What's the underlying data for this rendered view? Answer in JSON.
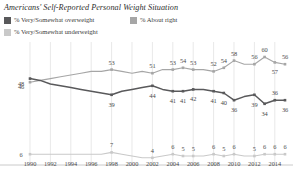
{
  "chart_data": {
    "type": "line",
    "title": "Americans' Self-Reported Personal Weight Situation",
    "xlabel": "",
    "ylabel": "",
    "ylim": [
      0,
      65
    ],
    "xlim": [
      1990,
      2015
    ],
    "grid": "vertical",
    "legend_position": "top-left",
    "x": [
      1990,
      1991,
      1992,
      1993,
      1994,
      1995,
      1996,
      1997,
      1998,
      1999,
      2000,
      2001,
      2002,
      2003,
      2004,
      2005,
      2006,
      2007,
      2008,
      2009,
      2010,
      2011,
      2012,
      2013,
      2014,
      2015
    ],
    "tick_labels": [
      "1990",
      "1992",
      "1994",
      "1996",
      "1998",
      "2000",
      "2002",
      "2004",
      "2006",
      "2008",
      "2010",
      "2012",
      "2014"
    ],
    "series": [
      {
        "name": "% Very/Somewhat overweight",
        "color": "#59595b",
        "values": [
          48,
          47,
          45,
          44,
          43,
          42,
          41,
          40,
          39,
          41,
          42,
          43,
          44,
          42,
          41,
          41,
          42,
          42,
          41,
          40,
          36,
          38,
          39,
          34,
          36,
          36
        ],
        "labels": [
          {
            "x": 1990,
            "value": 48,
            "text": "48"
          },
          {
            "x": 1998,
            "value": 39,
            "text": "39"
          },
          {
            "x": 2002,
            "value": 44,
            "text": "44"
          },
          {
            "x": 2004,
            "value": 41,
            "text": "41"
          },
          {
            "x": 2005,
            "value": 41,
            "text": "41"
          },
          {
            "x": 2006,
            "value": 42,
            "text": "42"
          },
          {
            "x": 2008,
            "value": 41,
            "text": "41"
          },
          {
            "x": 2009,
            "value": 40,
            "text": "40"
          },
          {
            "x": 2010,
            "value": 36,
            "text": "36"
          },
          {
            "x": 2012,
            "value": 39,
            "text": "39"
          },
          {
            "x": 2013,
            "value": 34,
            "text": "34"
          },
          {
            "x": 2014,
            "value": 36,
            "text": "36"
          },
          {
            "x": 2015,
            "value": 36,
            "text": "36"
          }
        ]
      },
      {
        "name": "% About right",
        "color": "#a6a6a6",
        "values": [
          46,
          47,
          48,
          49,
          50,
          51,
          52,
          52,
          53,
          52,
          51,
          52,
          51,
          53,
          53,
          54,
          53,
          53,
          52,
          54,
          58,
          56,
          56,
          60,
          57,
          56
        ],
        "labels": [
          {
            "x": 1990,
            "value": 46,
            "text": "46"
          },
          {
            "x": 1998,
            "value": 53,
            "text": "53"
          },
          {
            "x": 2002,
            "value": 51,
            "text": "51"
          },
          {
            "x": 2004,
            "value": 53,
            "text": "53"
          },
          {
            "x": 2005,
            "value": 54,
            "text": "54"
          },
          {
            "x": 2006,
            "value": 53,
            "text": "53"
          },
          {
            "x": 2008,
            "value": 52,
            "text": "52"
          },
          {
            "x": 2009,
            "value": 54,
            "text": "54"
          },
          {
            "x": 2010,
            "value": 58,
            "text": "58"
          },
          {
            "x": 2012,
            "value": 56,
            "text": "56"
          },
          {
            "x": 2013,
            "value": 60,
            "text": "60"
          },
          {
            "x": 2014,
            "value": 57,
            "text": "57"
          },
          {
            "x": 2015,
            "value": 56,
            "text": "56"
          }
        ]
      },
      {
        "name": "% Very/Somewhat underweight",
        "color": "#c9c9c9",
        "values": [
          6,
          6,
          6,
          6,
          6,
          6,
          6,
          6,
          7,
          6,
          5,
          4,
          4,
          5,
          6,
          5,
          5,
          5,
          6,
          5,
          6,
          5,
          5,
          6,
          6,
          6
        ],
        "labels": [
          {
            "x": 1990,
            "value": 6,
            "text": "6"
          },
          {
            "x": 1998,
            "value": 7,
            "text": "7"
          },
          {
            "x": 2002,
            "value": 4,
            "text": "4"
          },
          {
            "x": 2004,
            "value": 6,
            "text": "6"
          },
          {
            "x": 2005,
            "value": 5,
            "text": "5"
          },
          {
            "x": 2006,
            "value": 5,
            "text": "5"
          },
          {
            "x": 2008,
            "value": 6,
            "text": "6"
          },
          {
            "x": 2009,
            "value": 5,
            "text": "5"
          },
          {
            "x": 2010,
            "value": 6,
            "text": "6"
          },
          {
            "x": 2012,
            "value": 5,
            "text": "5"
          },
          {
            "x": 2013,
            "value": 6,
            "text": "6"
          },
          {
            "x": 2014,
            "value": 6,
            "text": "6"
          },
          {
            "x": 2015,
            "value": 6,
            "text": "6"
          }
        ]
      }
    ]
  },
  "legend": {
    "items": [
      {
        "label": "% Very/Somewhat overweight",
        "color": "#59595b"
      },
      {
        "label": "% About right",
        "color": "#a6a6a6"
      },
      {
        "label": "% Very/Somewhat underweight",
        "color": "#c9c9c9"
      }
    ]
  },
  "colors": {
    "overweight": "#59595b",
    "about_right": "#a6a6a6",
    "underweight": "#c9c9c9",
    "gridline": "#d8d8d8",
    "axis": "#bdbdbd",
    "text": "#4a4a4a"
  }
}
